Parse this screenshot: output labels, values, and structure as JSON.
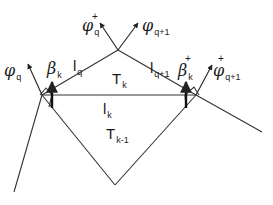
{
  "diagram": {
    "type": "triangulation-edge-rotation",
    "colors": {
      "stroke": "#333333",
      "text": "#1a1a1a",
      "background": "#ffffff"
    },
    "vertices": {
      "left": [
        42,
        95
      ],
      "right": [
        196,
        95
      ],
      "apex": [
        118,
        50
      ],
      "bottom": [
        115,
        185
      ],
      "left_tail_end": [
        14,
        192
      ],
      "right_tail_end": [
        262,
        132
      ],
      "right_upper": [
        231,
        33
      ]
    },
    "labels": {
      "phi_q": {
        "base": "φ",
        "sub": "q",
        "sup": ""
      },
      "phi_q_plus": {
        "base": "φ",
        "sub": "q",
        "sup": "+"
      },
      "phi_q1": {
        "base": "φ",
        "sub": "q+1",
        "sup": ""
      },
      "phi_q1_plus": {
        "base": "φ",
        "sub": "q+1",
        "sup": "+"
      },
      "beta_k": {
        "base": "β",
        "sub": "k",
        "sup": ""
      },
      "beta_k_plus": {
        "base": "β",
        "sub": "k",
        "sup": "+"
      },
      "l_q": {
        "base": "l",
        "sub": "q"
      },
      "l_q1": {
        "base": "l",
        "sub": "q+1"
      },
      "l_k": {
        "base": "l",
        "sub": "k"
      },
      "t_k": {
        "base": "T",
        "sub": "k"
      },
      "t_k1": {
        "base": "T",
        "sub": "k-1"
      }
    }
  }
}
